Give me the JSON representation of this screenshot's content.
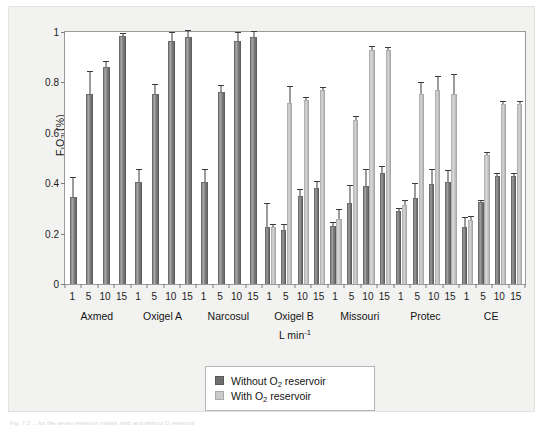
{
  "figure": {
    "background_color": "#f2f2f0",
    "plot_background_color": "#ffffff",
    "caption_partial": "Fig. 7.3  ... for the seven reservoir masks, with and without O  reservoir"
  },
  "axes": {
    "y_title_prefix": "F",
    "y_title_sub_i": "I",
    "y_title_o": "O",
    "y_title_sub_2": "2",
    "y_title_units": " (%)",
    "x_title_main": "L min",
    "x_title_sup": "-1"
  },
  "legend": {
    "position": "bottom-center",
    "items": [
      {
        "label_pre": "Without O",
        "label_sub": "2",
        "label_post": " reservoir",
        "color": "#6f6f6f",
        "key": "without-reservoir"
      },
      {
        "label_pre": "With O",
        "label_sub": "2",
        "label_post": " reservoir",
        "color": "#cacaca",
        "key": "with-reservoir"
      }
    ]
  },
  "chart_data": {
    "type": "bar",
    "title": "",
    "xlabel": "L min-1",
    "ylabel": "FIO2 (%)",
    "ylim": [
      0,
      1
    ],
    "yticks": [
      "0",
      "0.2",
      "0.4",
      "0.6",
      "0.8",
      "1"
    ],
    "ytick_values": [
      0,
      0.2,
      0.4,
      0.6,
      0.8,
      1
    ],
    "grid": false,
    "group_labels": [
      "Axmed",
      "Oxigel A",
      "Narcosul",
      "Oxigel B",
      "Missouri",
      "Protec",
      "CE"
    ],
    "flow_rates": [
      "1",
      "5",
      "10",
      "15"
    ],
    "series": [
      {
        "name": "Without O2 reservoir",
        "color": "#6f6f6f"
      },
      {
        "name": "With O2 reservoir",
        "color": "#cacaca"
      }
    ],
    "groups": [
      {
        "name": "Axmed",
        "paired": false,
        "without_reservoir": {
          "values": [
            0.345,
            0.755,
            0.86,
            0.985
          ],
          "errors": [
            0.08,
            0.09,
            0.025,
            0.012
          ]
        },
        "with_reservoir": {
          "values": [
            null,
            null,
            null,
            null
          ],
          "errors": [
            null,
            null,
            null,
            null
          ]
        }
      },
      {
        "name": "Oxigel A",
        "paired": false,
        "without_reservoir": {
          "values": [
            0.405,
            0.755,
            0.965,
            0.98
          ],
          "errors": [
            0.05,
            0.04,
            0.035,
            0.028
          ]
        },
        "with_reservoir": {
          "values": [
            null,
            null,
            null,
            null
          ],
          "errors": [
            null,
            null,
            null,
            null
          ]
        }
      },
      {
        "name": "Narcosul",
        "paired": false,
        "without_reservoir": {
          "values": [
            0.405,
            0.76,
            0.965,
            0.98
          ],
          "errors": [
            0.05,
            0.03,
            0.035,
            0.025
          ]
        },
        "with_reservoir": {
          "values": [
            null,
            null,
            null,
            null
          ],
          "errors": [
            null,
            null,
            null,
            null
          ]
        }
      },
      {
        "name": "Oxigel B",
        "paired": true,
        "without_reservoir": {
          "values": [
            0.225,
            0.215,
            0.35,
            0.38
          ],
          "errors": [
            0.095,
            0.022,
            0.028,
            0.028
          ]
        },
        "with_reservoir": {
          "values": [
            0.225,
            0.72,
            0.73,
            0.77
          ],
          "errors": [
            0.012,
            0.065,
            0.012,
            0.01
          ]
        }
      },
      {
        "name": "Missouri",
        "paired": true,
        "without_reservoir": {
          "values": [
            0.23,
            0.32,
            0.39,
            0.44
          ],
          "errors": [
            0.015,
            0.072,
            0.065,
            0.028
          ]
        },
        "with_reservoir": {
          "values": [
            0.258,
            0.65,
            0.93,
            0.93
          ],
          "errors": [
            0.04,
            0.015,
            0.013,
            0.012
          ]
        }
      },
      {
        "name": "Protec",
        "paired": true,
        "without_reservoir": {
          "values": [
            0.29,
            0.34,
            0.398,
            0.403
          ],
          "errors": [
            0.012,
            0.062,
            0.058,
            0.048
          ]
        },
        "with_reservoir": {
          "values": [
            0.315,
            0.755,
            0.77,
            0.755
          ],
          "errors": [
            0.017,
            0.046,
            0.055,
            0.08
          ]
        }
      },
      {
        "name": "CE",
        "paired": true,
        "without_reservoir": {
          "values": [
            0.225,
            0.325,
            0.43,
            0.43
          ],
          "errors": [
            0.04,
            0.01,
            0.012,
            0.012
          ]
        },
        "with_reservoir": {
          "values": [
            0.255,
            0.51,
            0.715,
            0.715
          ],
          "errors": [
            0.013,
            0.012,
            0.012,
            0.01
          ]
        }
      }
    ]
  }
}
